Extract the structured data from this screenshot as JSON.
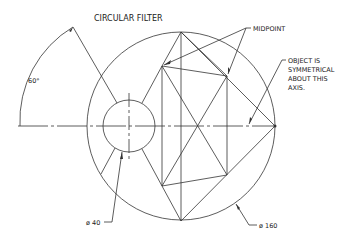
{
  "title": "CIRCULAR FILTER",
  "labels": {
    "angle": "60°",
    "midpoint": "MIDPOINT",
    "note_line1": "OBJECT IS",
    "note_line2": "SYMMETRICAL",
    "note_line3": "ABOUT THIS",
    "note_line4": "AXIS.",
    "small_diameter": "ø 40",
    "large_diameter": "ø 160"
  },
  "colors": {
    "line": "#333333",
    "text": "#222222",
    "background": "#ffffff"
  }
}
